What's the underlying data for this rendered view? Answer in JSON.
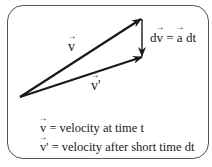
{
  "diagram": {
    "title": "",
    "vectors": [
      {
        "id": "v",
        "label": "v",
        "from": [
          20,
          97
        ],
        "to": [
          142,
          18
        ]
      },
      {
        "id": "v_prime",
        "label": "v'",
        "from": [
          20,
          97
        ],
        "to": [
          143,
          57
        ]
      },
      {
        "id": "dv",
        "label": "dv = a dt",
        "from": [
          142,
          18
        ],
        "to": [
          142,
          57
        ]
      }
    ],
    "labels": {
      "v": "v",
      "v_prime_base": "v",
      "v_prime_mark": "'",
      "dv_d": "d",
      "dv_v": "v",
      "dv_eq": " = ",
      "dv_a": "a",
      "dv_dt": " dt"
    },
    "legend": [
      {
        "symbol": "v",
        "mark": "",
        "text": " = velocity at time t"
      },
      {
        "symbol": "v",
        "mark": "'",
        "text": " = velocity after short time dt"
      }
    ],
    "colors": {
      "stroke": "#1a1a1a",
      "frame": "#555555",
      "background": "#ffffff"
    }
  }
}
